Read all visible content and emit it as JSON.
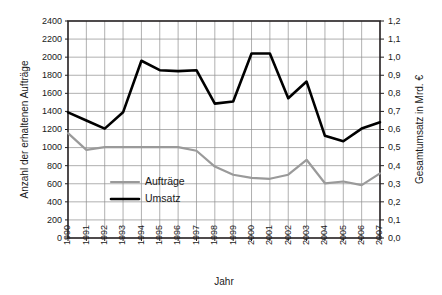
{
  "chart_data": {
    "type": "line",
    "title": "",
    "xlabel": "Jahr",
    "ylabel": "Anzahl der erhaltenen Aufträge",
    "y2label": "Gesamtumsatz in Mrd. €",
    "grid": true,
    "legend_position": "inside-lower-left",
    "categories": [
      "1990",
      "1991",
      "1992",
      "1993",
      "1994",
      "1995",
      "1996",
      "1997",
      "1998",
      "1999",
      "2000",
      "2001",
      "2002",
      "2003",
      "2004",
      "2005",
      "2006",
      "2007"
    ],
    "ylim": [
      0,
      2400
    ],
    "ytick_step": 200,
    "yticks": [
      "0",
      "200",
      "400",
      "600",
      "800",
      "1000",
      "1200",
      "1400",
      "1600",
      "1800",
      "2000",
      "2200",
      "2400"
    ],
    "y2lim": [
      0.0,
      1.2
    ],
    "y2tick_step": 0.1,
    "y2ticks": [
      "0,0",
      "0,1",
      "0,2",
      "0,3",
      "0,4",
      "0,5",
      "0,6",
      "0,7",
      "0,8",
      "0,9",
      "1,0",
      "1,1",
      "1,2"
    ],
    "series": [
      {
        "name": "Aufträge",
        "axis": "left",
        "color": "#9a9a9a",
        "values": [
          1160,
          975,
          1005,
          1005,
          1005,
          1005,
          1005,
          965,
          790,
          700,
          665,
          655,
          700,
          865,
          605,
          625,
          585,
          715
        ]
      },
      {
        "name": "Umsatz",
        "axis": "right",
        "color": "#000000",
        "values": [
          0.695,
          0.65,
          0.605,
          0.695,
          0.98,
          0.928,
          0.923,
          0.928,
          0.743,
          0.755,
          1.02,
          1.02,
          0.773,
          0.865,
          0.565,
          0.535,
          0.605,
          0.64
        ]
      }
    ],
    "legend": [
      {
        "label": "Aufträge",
        "color": "#9a9a9a"
      },
      {
        "label": "Umsatz",
        "color": "#000000"
      }
    ]
  }
}
